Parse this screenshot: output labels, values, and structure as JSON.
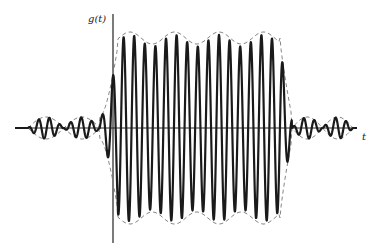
{
  "figure": {
    "y_axis_label": "g(t)",
    "x_axis_label": "t",
    "colors": {
      "background": "#ffffff",
      "waveform": "#1a1a1a",
      "envelope": "#777777",
      "axis": "#222222"
    }
  },
  "chart_data": {
    "type": "line",
    "title": "",
    "xlabel": "t",
    "ylabel": "g(t)",
    "series": [
      {
        "name": "g(t) waveform",
        "style": "solid"
      },
      {
        "name": "envelope",
        "style": "dashed"
      }
    ],
    "main_pulse": {
      "envelope_peaks": 4,
      "carrier_cycles_approx": 17
    },
    "sidelobes": {
      "left_humps": 2,
      "right_humps": 2
    },
    "grid": false,
    "legend": false
  }
}
